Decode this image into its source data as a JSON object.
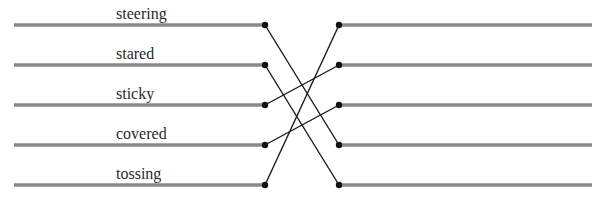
{
  "diagram": {
    "type": "matching",
    "left_words": [
      "steering",
      "stared",
      "sticky",
      "covered",
      "tossing"
    ],
    "right_count": 5,
    "connections": [
      {
        "from_left": 0,
        "to_right": 3
      },
      {
        "from_left": 1,
        "to_right": 4
      },
      {
        "from_left": 2,
        "to_right": 1
      },
      {
        "from_left": 3,
        "to_right": 2
      },
      {
        "from_left": 4,
        "to_right": 0
      }
    ],
    "colors": {
      "bar": "#8a8a8a",
      "connector": "#1a1a1a",
      "dot": "#111111",
      "text": "#2a2a2a"
    }
  }
}
